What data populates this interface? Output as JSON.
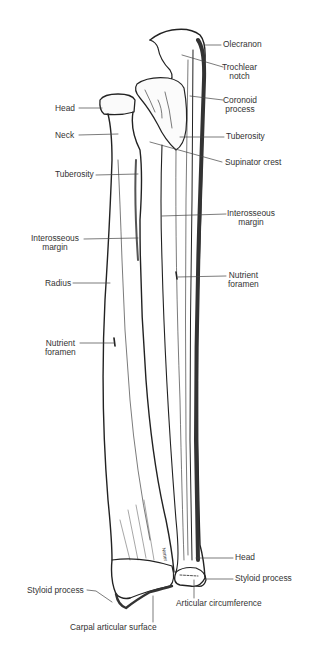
{
  "figure": {
    "labels": {
      "olecranon": "Olecranon",
      "trochlear_notch": [
        "Trochlear",
        "notch"
      ],
      "coronoid_process": [
        "Coronoid",
        "process"
      ],
      "head_radius": "Head",
      "neck": "Neck",
      "tuberosity_ulna": "Tuberosity",
      "supinator_crest": "Supinator crest",
      "tuberosity_radius": "Tuberosity",
      "interosseous_margin_ulna": [
        "Interosseous",
        "margin"
      ],
      "interosseous_margin_radius": [
        "Interosseous",
        "margin"
      ],
      "nutrient_foramen_ulna": [
        "Nutrient",
        "foramen"
      ],
      "radius": "Radius",
      "nutrient_foramen_radius": [
        "Nutrient",
        "foramen"
      ],
      "head_ulna": "Head",
      "styloid_process_ulna": "Styloid process",
      "styloid_process_radius": "Styloid process",
      "articular_circumference": "Articular circumference",
      "carpal_articular_surface": "Carpal articular surface"
    },
    "signature": "Netter",
    "colors": {
      "ink": "#222222",
      "label_text": "#333333",
      "background": "#ffffff"
    }
  }
}
